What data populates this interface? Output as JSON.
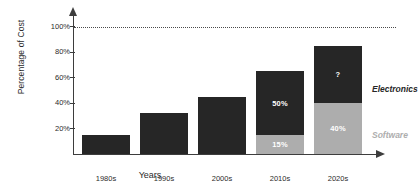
{
  "chart_data": {
    "type": "bar",
    "title": "",
    "xlabel": "Years",
    "ylabel": "Percentage of Cost",
    "categories": [
      "1980s",
      "1990s",
      "2000s",
      "2010s",
      "2020s"
    ],
    "ylim": [
      0,
      110
    ],
    "yticks": [
      20,
      40,
      60,
      80,
      100
    ],
    "ytick_labels": [
      "20%",
      "40%",
      "60%",
      "80%",
      "100%"
    ],
    "grid": false,
    "stacked": true,
    "legend_position": "right",
    "reference_line": {
      "value": 100,
      "label": "100%",
      "style": "dotted"
    },
    "series": [
      {
        "name": "Software",
        "color": "#adadad",
        "values": [
          0,
          0,
          0,
          15,
          40
        ],
        "value_labels": [
          "",
          "",
          "",
          "15%",
          "40%"
        ]
      },
      {
        "name": "Electronics",
        "color": "#262626",
        "values": [
          15,
          32,
          45,
          50,
          45
        ],
        "value_labels": [
          "",
          "",
          "",
          "50%",
          "?"
        ]
      }
    ],
    "totals": [
      15,
      32,
      45,
      65,
      85
    ]
  },
  "legend": {
    "electronics": "Electronics",
    "software": "Software"
  },
  "colors": {
    "electronics": "#262626",
    "software": "#adadad",
    "axis": "#3d3d3d",
    "text": "#2b2b2b",
    "background": "#ffffff"
  }
}
